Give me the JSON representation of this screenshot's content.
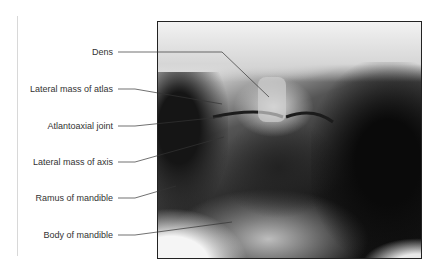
{
  "figure": {
    "image_description": "Anteroposterior open-mouth radiograph of upper cervical spine",
    "labels": [
      {
        "id": "dens",
        "text": "Dens"
      },
      {
        "id": "lateral-mass-atlas",
        "text": "Lateral mass of atlas"
      },
      {
        "id": "atlantoaxial-joint",
        "text": "Atlantoaxial joint"
      },
      {
        "id": "lateral-mass-axis",
        "text": "Lateral mass of axis"
      },
      {
        "id": "ramus-mandible",
        "text": "Ramus of mandible"
      },
      {
        "id": "body-mandible",
        "text": "Body of mandible"
      }
    ]
  }
}
